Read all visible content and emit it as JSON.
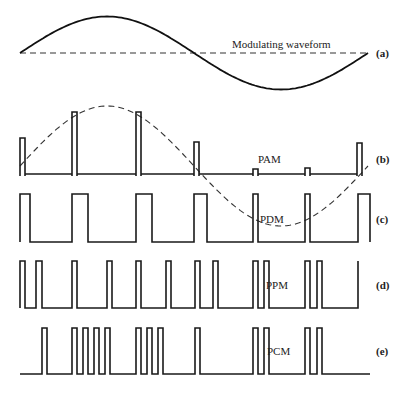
{
  "figure": {
    "panels": [
      {
        "id": "a",
        "tag": "(a)",
        "label": "Modulating waveform",
        "label_pos": [
          232,
          48
        ],
        "tag_pos": [
          376,
          57
        ]
      },
      {
        "id": "b",
        "tag": "(b)",
        "label": "PAM",
        "label_pos": [
          258,
          163
        ],
        "tag_pos": [
          376,
          163
        ]
      },
      {
        "id": "c",
        "tag": "(c)",
        "label": "PDM",
        "label_pos": [
          260,
          223
        ],
        "tag_pos": [
          376,
          223
        ]
      },
      {
        "id": "d",
        "tag": "(d)",
        "label": "PPM",
        "label_pos": [
          266,
          289
        ],
        "tag_pos": [
          376,
          289
        ]
      },
      {
        "id": "e",
        "tag": "(e)",
        "label": "PCM",
        "label_pos": [
          267,
          355
        ],
        "tag_pos": [
          376,
          355
        ]
      }
    ],
    "modulating": {
      "x_start": 20,
      "x_end": 368,
      "center_y": 53,
      "amplitude": 36.5,
      "peak": [
        107,
        17
      ],
      "trough": [
        280,
        90
      ]
    },
    "pam": {
      "baseline_y": 174,
      "bottom_y": 176,
      "pulse_width": 5,
      "pulses": [
        {
          "x": 20,
          "top": 138
        },
        {
          "x": 72,
          "top": 112
        },
        {
          "x": 136,
          "top": 112
        },
        {
          "x": 194,
          "top": 142
        },
        {
          "x": 253,
          "top": 169
        },
        {
          "x": 305,
          "top": 168
        },
        {
          "x": 357,
          "top": 143
        }
      ],
      "envelope": {
        "x_start": 20,
        "x_end": 368,
        "center_y": 166,
        "amplitude": 60
      }
    },
    "pdm": {
      "baseline_y": 242,
      "top_y": 194,
      "pulses": [
        [
          20,
          30
        ],
        [
          72,
          88
        ],
        [
          136,
          152
        ],
        [
          194,
          207
        ],
        [
          253,
          258
        ],
        [
          305,
          310
        ],
        [
          358,
          370
        ]
      ]
    },
    "ppm": {
      "baseline_y": 308,
      "top_y": 261,
      "pulses": [
        [
          20,
          25
        ],
        [
          36,
          42
        ],
        [
          72,
          77
        ],
        [
          107,
          112
        ],
        [
          136,
          141
        ],
        [
          166,
          171
        ],
        [
          195,
          200
        ],
        [
          213,
          218
        ],
        [
          253,
          258
        ],
        [
          264,
          269
        ],
        [
          305,
          310
        ],
        [
          317,
          322
        ]
      ],
      "final_edge_x": 358
    },
    "pcm": {
      "baseline_y": 374,
      "top_y": 328,
      "x_start": 20,
      "x_end": 370,
      "pulses": [
        [
          42,
          47
        ],
        [
          72,
          77
        ],
        [
          83,
          88
        ],
        [
          94,
          99
        ],
        [
          105,
          110
        ],
        [
          136,
          141
        ],
        [
          147,
          152
        ],
        [
          158,
          163
        ],
        [
          195,
          200
        ],
        [
          253,
          258
        ],
        [
          264,
          269
        ],
        [
          305,
          310
        ],
        [
          317,
          322
        ]
      ]
    }
  }
}
